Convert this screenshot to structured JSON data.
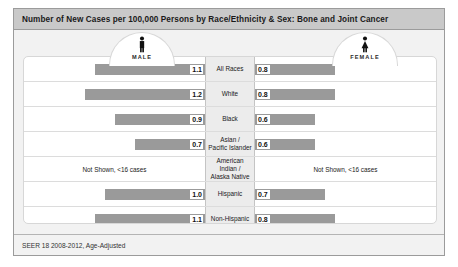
{
  "title": "Number of New Cases per 100,000 Persons by Race/Ethnicity & Sex: Bone and Joint Cancer",
  "footer": "SEER 18 2008-2012, Age-Adjusted",
  "panels": {
    "male": {
      "label": "MALE",
      "icon": "male-figure-icon"
    },
    "female": {
      "label": "FEMALE",
      "icon": "female-figure-icon"
    }
  },
  "not_shown_text": "Not Shown, <16 cases",
  "colors": {
    "bar_fill": "#9a9a9a",
    "title_bar": "#c9c9c9",
    "card_bg": "#f2f2f2",
    "panel_bg": "#ffffff",
    "category_bg": "#ececec"
  },
  "chart_data": {
    "type": "bar",
    "title": "Number of New Cases per 100,000 Persons by Race/Ethnicity & Sex: Bone and Joint Cancer",
    "subtitle": "SEER 18 2008-2012, Age-Adjusted",
    "xlabel": "Rate per 100,000 persons",
    "ylabel": "Race/Ethnicity",
    "orientation": "horizontal-bidirectional",
    "grid": false,
    "legend_position": "top",
    "xlim": [
      0,
      1.3
    ],
    "categories": [
      "All Races",
      "White",
      "Black",
      "Asian / Pacific Islander",
      "American Indian / Alaska Native",
      "Hispanic",
      "Non-Hispanic"
    ],
    "series": [
      {
        "name": "MALE",
        "side": "left",
        "values": [
          1.1,
          1.2,
          0.9,
          0.7,
          null,
          1.0,
          1.1
        ],
        "labels": [
          "1.1",
          "1.2",
          "0.9",
          "0.7",
          "Not Shown, <16 cases",
          "1.0",
          "1.1"
        ]
      },
      {
        "name": "FEMALE",
        "side": "right",
        "values": [
          0.8,
          0.8,
          0.6,
          0.6,
          null,
          0.7,
          0.8
        ],
        "labels": [
          "0.8",
          "0.8",
          "0.6",
          "0.6",
          "Not Shown, <16 cases",
          "0.7",
          "0.8"
        ]
      }
    ]
  }
}
